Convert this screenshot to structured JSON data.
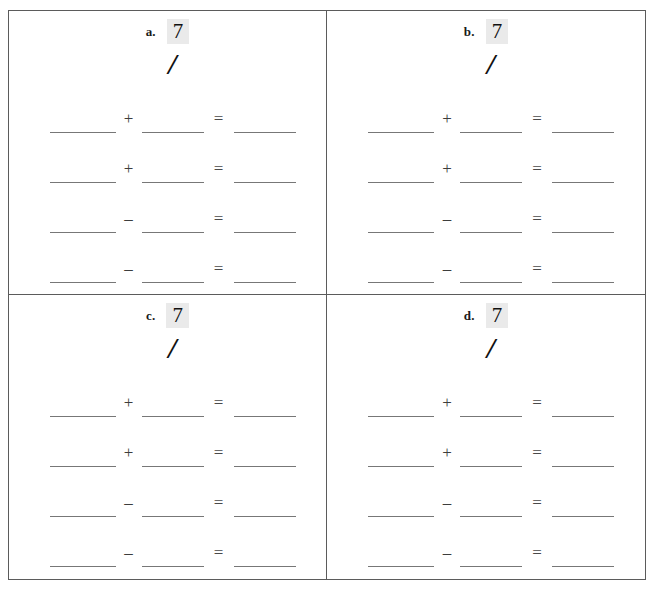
{
  "page": {
    "top_artifact_text": "··",
    "background_color": "#ffffff",
    "border_color": "#5b5b5b",
    "highlight_color": "#eaeaea",
    "blank_line_color": "#777777",
    "operator_color": "#3d3d3d"
  },
  "worksheet": {
    "columns": 2,
    "rows": 2,
    "cells": [
      {
        "label": "a.",
        "number": "7",
        "tally": "/",
        "equations": [
          {
            "blank1": "",
            "operator": "+",
            "blank2": "",
            "equals": "=",
            "blank3": ""
          },
          {
            "blank1": "",
            "operator": "+",
            "blank2": "",
            "equals": "=",
            "blank3": ""
          },
          {
            "blank1": "",
            "operator": "–",
            "blank2": "",
            "equals": "=",
            "blank3": ""
          },
          {
            "blank1": "",
            "operator": "–",
            "blank2": "",
            "equals": "=",
            "blank3": ""
          }
        ]
      },
      {
        "label": "b.",
        "number": "7",
        "tally": "/",
        "equations": [
          {
            "blank1": "",
            "operator": "+",
            "blank2": "",
            "equals": "=",
            "blank3": ""
          },
          {
            "blank1": "",
            "operator": "+",
            "blank2": "",
            "equals": "=",
            "blank3": ""
          },
          {
            "blank1": "",
            "operator": "–",
            "blank2": "",
            "equals": "=",
            "blank3": ""
          },
          {
            "blank1": "",
            "operator": "–",
            "blank2": "",
            "equals": "=",
            "blank3": ""
          }
        ]
      },
      {
        "label": "c.",
        "number": "7",
        "tally": "/",
        "equations": [
          {
            "blank1": "",
            "operator": "+",
            "blank2": "",
            "equals": "=",
            "blank3": ""
          },
          {
            "blank1": "",
            "operator": "+",
            "blank2": "",
            "equals": "=",
            "blank3": ""
          },
          {
            "blank1": "",
            "operator": "–",
            "blank2": "",
            "equals": "=",
            "blank3": ""
          },
          {
            "blank1": "",
            "operator": "–",
            "blank2": "",
            "equals": "=",
            "blank3": ""
          }
        ]
      },
      {
        "label": "d.",
        "number": "7",
        "tally": "/",
        "equations": [
          {
            "blank1": "",
            "operator": "+",
            "blank2": "",
            "equals": "=",
            "blank3": ""
          },
          {
            "blank1": "",
            "operator": "+",
            "blank2": "",
            "equals": "=",
            "blank3": ""
          },
          {
            "blank1": "",
            "operator": "–",
            "blank2": "",
            "equals": "=",
            "blank3": ""
          },
          {
            "blank1": "",
            "operator": "–",
            "blank2": "",
            "equals": "=",
            "blank3": ""
          }
        ]
      }
    ]
  }
}
